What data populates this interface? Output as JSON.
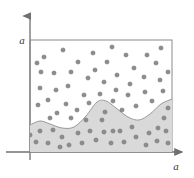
{
  "figure": {
    "type": "scatter-with-shaded-region",
    "background_color": "#ffffff",
    "axes": {
      "y_axis_label": "a",
      "x_axis_label": "a",
      "axis_color": "#707070",
      "arrow_style": "filled-triangle",
      "y_axis_x": 30,
      "y_axis_top": 12,
      "y_axis_bottom": 160,
      "x_axis_y": 152,
      "x_axis_left": 6,
      "x_axis_right": 186,
      "y_label_position": {
        "x": 22,
        "y": 44
      },
      "x_label_position": {
        "x": 176,
        "y": 170
      }
    },
    "plot_frame": {
      "left": 30,
      "top": 40,
      "right": 172,
      "bottom": 152,
      "stroke_color": "#8a8a8a",
      "stroke_width": 1,
      "fill": "none"
    },
    "shaded_region": {
      "label": "lower-region",
      "fill_color": "#d9d9d9",
      "stroke_color": "#9a9a9a",
      "stroke_width": 1,
      "description": "wavy band filling the bottom of the plot, boundary undulating with a peak near x=100 and x=172 and troughs near x=62 and x=140",
      "boundary_points": [
        {
          "x": 30,
          "y": 125
        },
        {
          "x": 40,
          "y": 121
        },
        {
          "x": 50,
          "y": 124
        },
        {
          "x": 62,
          "y": 128
        },
        {
          "x": 74,
          "y": 127
        },
        {
          "x": 86,
          "y": 116
        },
        {
          "x": 97,
          "y": 102
        },
        {
          "x": 106,
          "y": 101
        },
        {
          "x": 116,
          "y": 108
        },
        {
          "x": 128,
          "y": 117
        },
        {
          "x": 139,
          "y": 120
        },
        {
          "x": 150,
          "y": 114
        },
        {
          "x": 161,
          "y": 104
        },
        {
          "x": 172,
          "y": 99
        }
      ]
    },
    "points": {
      "marker_color": "#8c8c8c",
      "marker_edge_color": "#6e6e6e",
      "marker_radius": 2.1,
      "count_upper": 46,
      "count_lower": 28,
      "upper_region_points": [
        {
          "x": 44,
          "y": 57
        },
        {
          "x": 63,
          "y": 50
        },
        {
          "x": 78,
          "y": 62
        },
        {
          "x": 71,
          "y": 72
        },
        {
          "x": 41,
          "y": 72
        },
        {
          "x": 54,
          "y": 73
        },
        {
          "x": 68,
          "y": 86
        },
        {
          "x": 40,
          "y": 88
        },
        {
          "x": 56,
          "y": 90
        },
        {
          "x": 93,
          "y": 53
        },
        {
          "x": 95,
          "y": 70
        },
        {
          "x": 107,
          "y": 62
        },
        {
          "x": 112,
          "y": 47
        },
        {
          "x": 117,
          "y": 75
        },
        {
          "x": 104,
          "y": 82
        },
        {
          "x": 88,
          "y": 78
        },
        {
          "x": 126,
          "y": 55
        },
        {
          "x": 134,
          "y": 68
        },
        {
          "x": 147,
          "y": 55
        },
        {
          "x": 156,
          "y": 63
        },
        {
          "x": 161,
          "y": 48
        },
        {
          "x": 144,
          "y": 77
        },
        {
          "x": 160,
          "y": 80
        },
        {
          "x": 130,
          "y": 84
        },
        {
          "x": 116,
          "y": 90
        },
        {
          "x": 100,
          "y": 94
        },
        {
          "x": 84,
          "y": 95
        },
        {
          "x": 48,
          "y": 100
        },
        {
          "x": 66,
          "y": 104
        },
        {
          "x": 38,
          "y": 105
        },
        {
          "x": 57,
          "y": 113
        },
        {
          "x": 77,
          "y": 110
        },
        {
          "x": 89,
          "y": 103
        },
        {
          "x": 113,
          "y": 101
        },
        {
          "x": 128,
          "y": 95
        },
        {
          "x": 145,
          "y": 92
        },
        {
          "x": 163,
          "y": 91
        },
        {
          "x": 152,
          "y": 101
        },
        {
          "x": 136,
          "y": 106
        },
        {
          "x": 122,
          "y": 110
        },
        {
          "x": 105,
          "y": 112
        },
        {
          "x": 71,
          "y": 118
        },
        {
          "x": 86,
          "y": 120
        },
        {
          "x": 50,
          "y": 118
        },
        {
          "x": 168,
          "y": 72
        },
        {
          "x": 37,
          "y": 63
        }
      ],
      "lower_region_points": [
        {
          "x": 40,
          "y": 131
        },
        {
          "x": 53,
          "y": 130
        },
        {
          "x": 36,
          "y": 142
        },
        {
          "x": 48,
          "y": 143
        },
        {
          "x": 62,
          "y": 137
        },
        {
          "x": 69,
          "y": 145
        },
        {
          "x": 82,
          "y": 143
        },
        {
          "x": 96,
          "y": 140
        },
        {
          "x": 102,
          "y": 120
        },
        {
          "x": 104,
          "y": 132
        },
        {
          "x": 113,
          "y": 131
        },
        {
          "x": 120,
          "y": 131
        },
        {
          "x": 111,
          "y": 143
        },
        {
          "x": 124,
          "y": 142
        },
        {
          "x": 136,
          "y": 137
        },
        {
          "x": 132,
          "y": 127
        },
        {
          "x": 146,
          "y": 145
        },
        {
          "x": 149,
          "y": 133
        },
        {
          "x": 158,
          "y": 128
        },
        {
          "x": 164,
          "y": 118
        },
        {
          "x": 166,
          "y": 131
        },
        {
          "x": 157,
          "y": 141
        },
        {
          "x": 168,
          "y": 143
        },
        {
          "x": 90,
          "y": 131
        },
        {
          "x": 78,
          "y": 133
        },
        {
          "x": 168,
          "y": 108
        },
        {
          "x": 60,
          "y": 147
        },
        {
          "x": 30,
          "y": 135
        }
      ]
    }
  }
}
